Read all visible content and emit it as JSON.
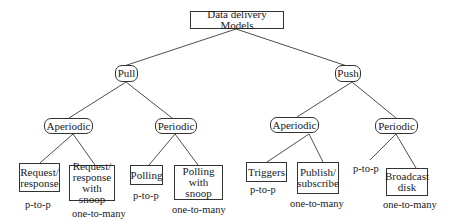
{
  "diagram": {
    "type": "tree",
    "root": {
      "id": "root",
      "label": "Data delivery Models"
    },
    "nodes": [
      {
        "id": "pull",
        "label": "Pull",
        "parent": "root"
      },
      {
        "id": "push",
        "label": "Push",
        "parent": "root"
      },
      {
        "id": "pull_aperiodic",
        "label": "Aperiodic",
        "parent": "pull"
      },
      {
        "id": "pull_periodic",
        "label": "Periodic",
        "parent": "pull"
      },
      {
        "id": "push_aperiodic",
        "label": "Aperiodic",
        "parent": "push"
      },
      {
        "id": "push_periodic",
        "label": "Periodic",
        "parent": "push"
      },
      {
        "id": "request_response",
        "label": "Request/\nresponse",
        "parent": "pull_aperiodic",
        "annotation": "p-to-p"
      },
      {
        "id": "request_response_snoop",
        "label": "Request/\nresponse\nwith snoop",
        "parent": "pull_aperiodic",
        "annotation": "one-to-many"
      },
      {
        "id": "polling",
        "label": "Polling",
        "parent": "pull_periodic",
        "annotation": "p-to-p"
      },
      {
        "id": "polling_snoop",
        "label": "Polling\nwith snoop",
        "parent": "pull_periodic",
        "annotation": "one-to-many"
      },
      {
        "id": "triggers",
        "label": "Triggers",
        "parent": "push_aperiodic",
        "annotation": "p-to-p"
      },
      {
        "id": "publish_subscribe",
        "label": "Publish/\nsubscribe",
        "parent": "push_aperiodic",
        "annotation": "one-to-many"
      },
      {
        "id": "push_periodic_p2p",
        "label": "",
        "parent": "push_periodic",
        "annotation": "p-to-p"
      },
      {
        "id": "broadcast_disk",
        "label": "Broadcast\ndisk",
        "parent": "push_periodic",
        "annotation": "one-to-many"
      }
    ]
  },
  "labels": {
    "root": "Data delivery Models",
    "pull": "Pull",
    "push": "Push",
    "pull_aperiodic": "Aperiodic",
    "pull_periodic": "Periodic",
    "push_aperiodic": "Aperiodic",
    "push_periodic": "Periodic",
    "request_response": "Request/\nresponse",
    "request_response_snoop": "Request/\nresponse\nwith snoop",
    "polling": "Polling",
    "polling_snoop": "Polling\nwith snoop",
    "triggers": "Triggers",
    "publish_subscribe": "Publish/\nsubscribe",
    "broadcast_disk": "Broadcast\ndisk"
  },
  "annotations": {
    "request_response": "p-to-p",
    "request_response_snoop": "one-to-many",
    "polling": "p-to-p",
    "polling_snoop": "one-to-many",
    "triggers": "p-to-p",
    "publish_subscribe": "one-to-many",
    "push_periodic_p2p": "p-to-p",
    "broadcast_disk": "one-to-many"
  },
  "colors": {
    "line": "#333333",
    "text": "#1a1a1a",
    "background": "#ffffff"
  }
}
